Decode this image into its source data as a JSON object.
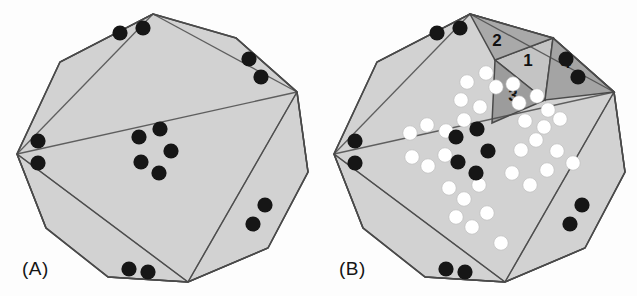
{
  "figure": {
    "title_visible": false,
    "background_color": "#fdfdfd",
    "panels": [
      {
        "id": "A",
        "label": "(A)",
        "label_pos": [
          22,
          258
        ],
        "description": "Shaded decagon with triangulation and black circular markers",
        "polygon_fill": "#d2d2d2",
        "edge_color": "#4a4a4a",
        "marker_black": "#161616",
        "center": [
          155,
          148
        ],
        "radius": 138,
        "vertices": [
          [
            153,
            14
          ],
          [
            236,
            38
          ],
          [
            297,
            92
          ],
          [
            308,
            172
          ],
          [
            268,
            248
          ],
          [
            188,
            282
          ],
          [
            108,
            277
          ],
          [
            46,
            228
          ],
          [
            17,
            154
          ],
          [
            60,
            62
          ]
        ],
        "diagonals": [
          [
            0,
            8
          ],
          [
            8,
            2
          ],
          [
            2,
            5
          ],
          [
            5,
            8
          ],
          [
            0,
            2
          ],
          [
            5,
            2
          ],
          [
            8,
            5
          ],
          [
            0,
            9
          ],
          [
            2,
            1
          ],
          [
            2,
            3
          ],
          [
            5,
            4
          ],
          [
            5,
            6
          ],
          [
            8,
            7
          ]
        ],
        "black_dots": [
          [
            120,
            33
          ],
          [
            143,
            28
          ],
          [
            249,
            59
          ],
          [
            261,
            77
          ],
          [
            265,
            205
          ],
          [
            253,
            224
          ],
          [
            129,
            269
          ],
          [
            148,
            272
          ],
          [
            38,
            141
          ],
          [
            38,
            163
          ],
          [
            139,
            137
          ],
          [
            160,
            129
          ],
          [
            171,
            151
          ],
          [
            141,
            162
          ],
          [
            159,
            173
          ]
        ],
        "white_dots": [],
        "black_dot_count": 15,
        "white_dot_count": 0
      },
      {
        "id": "B",
        "label": "(B)",
        "label_pos": [
          339,
          258
        ],
        "description": "Same decagon with numbered shaded ear triangles 1-4 and white circular markers",
        "polygon_fill": "#d2d2d2",
        "edge_color": "#4a4a4a",
        "marker_black": "#161616",
        "marker_white": "#ffffff",
        "center": [
          472,
          148
        ],
        "radius": 138,
        "vertices": [
          [
            470,
            14
          ],
          [
            553,
            38
          ],
          [
            614,
            92
          ],
          [
            625,
            172
          ],
          [
            585,
            248
          ],
          [
            505,
            282
          ],
          [
            425,
            277
          ],
          [
            363,
            228
          ],
          [
            334,
            154
          ],
          [
            377,
            62
          ]
        ],
        "diagonals": [
          [
            0,
            8
          ],
          [
            8,
            2
          ],
          [
            2,
            5
          ],
          [
            5,
            8
          ],
          [
            0,
            2
          ],
          [
            5,
            2
          ],
          [
            8,
            5
          ],
          [
            0,
            9
          ],
          [
            2,
            1
          ],
          [
            2,
            3
          ],
          [
            5,
            4
          ],
          [
            5,
            6
          ],
          [
            8,
            7
          ]
        ],
        "numbered_triangles": [
          {
            "number": "1",
            "fill": "#c4c4c4",
            "label_pos": [
              528,
              66
            ],
            "points": "495,60 553,38 545,100"
          },
          {
            "number": "2",
            "fill": "#a9a9a9",
            "label_pos": [
              497,
              46
            ],
            "points": "470,14 553,38 495,60"
          },
          {
            "number": "3",
            "fill": "#9c9c9c",
            "label_pos": [
              513,
              101
            ],
            "points": "495,60 545,100 492,123"
          },
          {
            "number": "4",
            "fill": "#a4a4a4",
            "label_pos": [
              566,
              68
            ],
            "points": "553,38 614,92 545,100"
          }
        ],
        "black_dots": [
          [
            437,
            33
          ],
          [
            460,
            28
          ],
          [
            566,
            59
          ],
          [
            578,
            77
          ],
          [
            582,
            205
          ],
          [
            570,
            224
          ],
          [
            446,
            269
          ],
          [
            465,
            272
          ],
          [
            355,
            141
          ],
          [
            355,
            163
          ],
          [
            456,
            137
          ],
          [
            477,
            129
          ],
          [
            488,
            151
          ],
          [
            458,
            162
          ],
          [
            476,
            173
          ]
        ],
        "white_dots": [
          [
            467,
            82
          ],
          [
            486,
            73
          ],
          [
            461,
            100
          ],
          [
            480,
            107
          ],
          [
            464,
            120
          ],
          [
            496,
            87
          ],
          [
            513,
            84
          ],
          [
            519,
            103
          ],
          [
            537,
            96
          ],
          [
            548,
            110
          ],
          [
            525,
            121
          ],
          [
            544,
            127
          ],
          [
            560,
            119
          ],
          [
            410,
            133
          ],
          [
            427,
            125
          ],
          [
            446,
            131
          ],
          [
            412,
            157
          ],
          [
            428,
            166
          ],
          [
            445,
            155
          ],
          [
            449,
            188
          ],
          [
            464,
            199
          ],
          [
            479,
            185
          ],
          [
            456,
            217
          ],
          [
            472,
            227
          ],
          [
            487,
            213
          ],
          [
            521,
            150
          ],
          [
            536,
            140
          ],
          [
            512,
            173
          ],
          [
            530,
            185
          ],
          [
            547,
            170
          ],
          [
            557,
            151
          ],
          [
            573,
            163
          ],
          [
            501,
            243
          ]
        ],
        "black_dot_count": 15,
        "white_dot_count": 33,
        "numbers": [
          "1",
          "2",
          "3",
          "4"
        ]
      }
    ]
  }
}
